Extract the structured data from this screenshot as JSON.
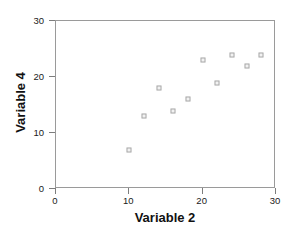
{
  "chart_data": {
    "type": "scatter",
    "title": "",
    "xlabel": "Variable 2",
    "ylabel": "Variable 4",
    "xlim": [
      0,
      30
    ],
    "ylim": [
      0,
      30
    ],
    "xticks": [
      0,
      10,
      20,
      30
    ],
    "yticks": [
      0,
      10,
      20,
      30
    ],
    "xticklabels": [
      "0",
      "10",
      "20",
      "30"
    ],
    "yticklabels": [
      "0",
      "10",
      "20",
      "30"
    ],
    "grid": false,
    "legend": null,
    "marker": "open-square",
    "marker_color": "#a8a8a8",
    "frame_color": "#9a9a9a",
    "points": [
      {
        "x": 10,
        "y": 7
      },
      {
        "x": 12,
        "y": 13
      },
      {
        "x": 14,
        "y": 18
      },
      {
        "x": 16,
        "y": 14
      },
      {
        "x": 18,
        "y": 16
      },
      {
        "x": 20,
        "y": 23
      },
      {
        "x": 22,
        "y": 19
      },
      {
        "x": 24,
        "y": 24
      },
      {
        "x": 26,
        "y": 22
      },
      {
        "x": 28,
        "y": 24
      }
    ],
    "x": [
      10,
      12,
      14,
      16,
      18,
      20,
      22,
      24,
      26,
      28
    ],
    "y": [
      7,
      13,
      18,
      14,
      16,
      23,
      19,
      24,
      22,
      24
    ]
  }
}
